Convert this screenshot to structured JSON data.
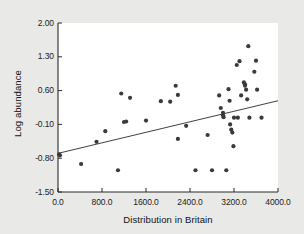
{
  "chart_data": {
    "type": "scatter",
    "title": "",
    "xlabel": "Distribution in Britain",
    "ylabel": "Log abundance",
    "xlim": [
      0.0,
      4000.0
    ],
    "ylim": [
      -1.5,
      2.0
    ],
    "xticks": [
      0.0,
      800.0,
      1600.0,
      2400.0,
      3200.0,
      4000.0
    ],
    "xtick_labels": [
      "0.0",
      "800.0",
      "1600.0",
      "2400.0",
      "3200.0",
      "4000.0"
    ],
    "yticks": [
      -1.5,
      -0.8,
      -0.1,
      0.6,
      1.3,
      2.0
    ],
    "ytick_labels": [
      "-1.50",
      "-0.80",
      "-0.10",
      "0.60",
      "1.30",
      "2.00"
    ],
    "grid": false,
    "legend": null,
    "marker": {
      "shape": "circle",
      "color": "#3a3a3a",
      "size": 4.2
    },
    "points": [
      [
        20,
        -0.72
      ],
      [
        35,
        -0.74
      ],
      [
        420,
        -0.92
      ],
      [
        700,
        -0.46
      ],
      [
        860,
        -0.24
      ],
      [
        1090,
        -1.05
      ],
      [
        1150,
        0.54
      ],
      [
        1200,
        -0.05
      ],
      [
        1240,
        -0.04
      ],
      [
        1310,
        0.45
      ],
      [
        1600,
        -0.02
      ],
      [
        1870,
        0.38
      ],
      [
        2040,
        0.37
      ],
      [
        2140,
        0.7
      ],
      [
        2180,
        0.51
      ],
      [
        2180,
        -0.4
      ],
      [
        2330,
        -0.13
      ],
      [
        2500,
        -1.05
      ],
      [
        2720,
        -0.32
      ],
      [
        2800,
        -1.05
      ],
      [
        2930,
        0.5
      ],
      [
        2960,
        0.24
      ],
      [
        3000,
        0.14
      ],
      [
        3000,
        0.09
      ],
      [
        3010,
        0.05
      ],
      [
        3060,
        -1.05
      ],
      [
        3100,
        0.63
      ],
      [
        3120,
        0.39
      ],
      [
        3130,
        -0.1
      ],
      [
        3150,
        -0.21
      ],
      [
        3170,
        -0.27
      ],
      [
        3190,
        -0.55
      ],
      [
        3200,
        0.04
      ],
      [
        3250,
        1.13
      ],
      [
        3270,
        0.04
      ],
      [
        3300,
        1.21
      ],
      [
        3330,
        0.5
      ],
      [
        3380,
        0.77
      ],
      [
        3400,
        0.73
      ],
      [
        3400,
        0.7
      ],
      [
        3420,
        0.62
      ],
      [
        3440,
        0.42
      ],
      [
        3460,
        1.52
      ],
      [
        3480,
        0.04
      ],
      [
        3570,
        0.99
      ],
      [
        3600,
        1.22
      ],
      [
        3620,
        0.62
      ],
      [
        3700,
        0.04
      ]
    ],
    "fit_line": {
      "type": "linear",
      "x0": 0.0,
      "y0": -0.7,
      "x1": 4000.0,
      "y1": 0.39,
      "color": "#2a2a2a",
      "width": 0.9
    }
  }
}
